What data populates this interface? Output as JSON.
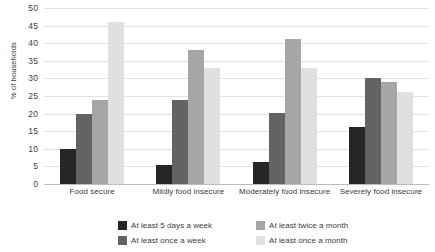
{
  "chart_data": {
    "type": "bar",
    "title": "",
    "xlabel": "",
    "ylabel": "% of households",
    "ylim": [
      0,
      50
    ],
    "ytick_step": 5,
    "yticks": [
      50,
      45,
      40,
      35,
      30,
      25,
      20,
      15,
      10,
      5,
      0
    ],
    "grid": true,
    "legend_position": "bottom",
    "categories": [
      "Food secure",
      "Mildly food insecure",
      "Moderately food insecure",
      "Severely food insecure"
    ],
    "series": [
      {
        "name": "At least 5 days a week",
        "color": "#262626",
        "values": [
          10.0,
          5.3,
          6.3,
          16.3
        ]
      },
      {
        "name": "At least once a week",
        "color": "#636363",
        "values": [
          19.9,
          23.9,
          20.1,
          30.1
        ]
      },
      {
        "name": "At least twice a month",
        "color": "#a6a6a6",
        "values": [
          23.8,
          38.1,
          41.1,
          29.1
        ]
      },
      {
        "name": "At least once a month",
        "color": "#e0e0e0",
        "values": [
          45.9,
          32.9,
          32.9,
          26.1
        ]
      }
    ]
  }
}
